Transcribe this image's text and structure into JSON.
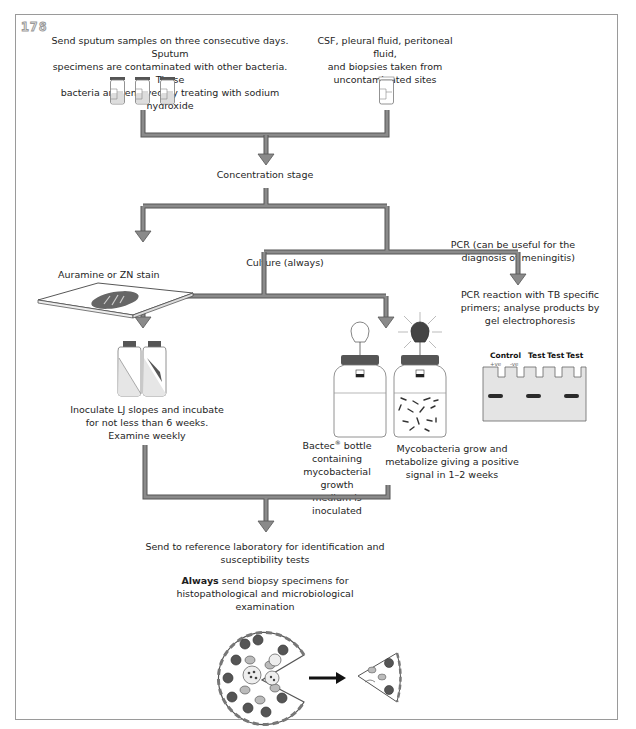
{
  "figure": {
    "number": "178",
    "colors": {
      "arrow_fill": "#8a8a8a",
      "arrow_stroke": "#555555",
      "frame": "#9a9a9a",
      "gel_fill": "#e4e4e4",
      "band": "#2a2a2a",
      "cap": "#555555"
    }
  },
  "sources": {
    "sputum": "Send sputum samples on three consecutive days. Sputum specimens are contaminated with other bacteria. These bacteria are removed by treating with sodium hydroxide",
    "sputum_lines": [
      "Send sputum samples on three consecutive days. Sputum",
      "specimens are contaminated with other bacteria. These",
      "bacteria are removed by treating with sodium hydroxide"
    ],
    "sterile_lines": [
      "CSF, pleural fluid, peritoneal fluid,",
      "and biopsies taken from",
      "uncontaminated sites"
    ]
  },
  "stages": {
    "concentration": "Concentration stage",
    "stain": "Auramine or ZN stain",
    "culture": "Culture (always)",
    "pcr_lines": [
      "PCR (can be useful for the",
      "diagnosis of meningitis)"
    ],
    "pcr_reaction_lines": [
      "PCR reaction with TB specific",
      "primers; analyse products by",
      "gel electrophoresis"
    ],
    "lj_lines": [
      "Inoculate LJ slopes and incubate",
      "for not less than 6 weeks.",
      "Examine weekly"
    ],
    "bactec_lines": {
      "first": "Bactec",
      "sup": "®",
      "first_rest": " bottle",
      "rest": [
        "containing",
        "mycobacterial growth",
        "medium is inoculated"
      ]
    },
    "growth_lines": [
      "Mycobacteria grow and",
      "metabolize giving a positive",
      "signal in 1–2 weeks"
    ],
    "reference_lines": [
      "Send to reference laboratory for identification and",
      "susceptibility tests"
    ],
    "biopsy": {
      "bold": "Always",
      "rest": " send biopsy specimens for",
      "line2": "histopathological and microbiological examination"
    }
  },
  "gel": {
    "labels": [
      "Control",
      "Test",
      "Test",
      "Test"
    ],
    "sublabels": [
      "+ve",
      "-ve"
    ],
    "lanes": [
      {
        "name": "+ve control",
        "band": true
      },
      {
        "name": "-ve control",
        "band": false
      },
      {
        "name": "test 1",
        "band": true
      },
      {
        "name": "test 2",
        "band": false
      },
      {
        "name": "test 3",
        "band": true
      }
    ]
  }
}
